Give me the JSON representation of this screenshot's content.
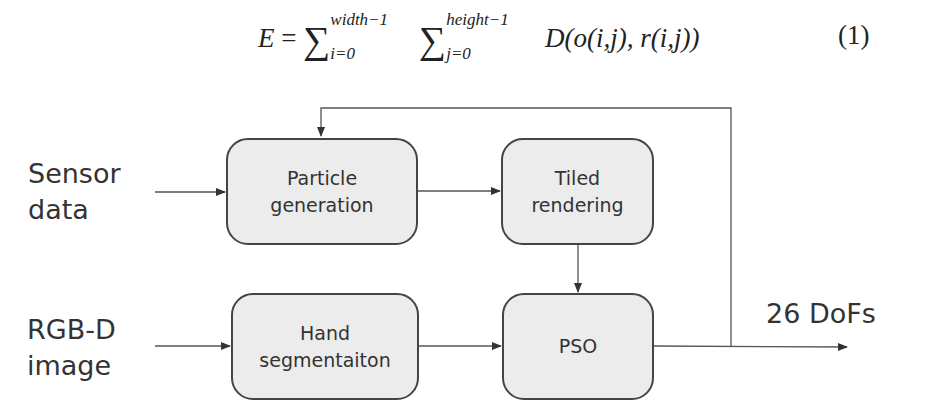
{
  "equation": {
    "lhs": "E",
    "eq": "=",
    "sum1_upper": "width−1",
    "sum1_lower": "i=0",
    "sum2_upper": "height−1",
    "sum2_lower": "j=0",
    "body": "D(o(i,j), r(i,j))",
    "number": "(1)"
  },
  "diagram": {
    "inputs": {
      "sensor_line1": "Sensor",
      "sensor_line2": "data",
      "rgbd_line1": "RGB-D",
      "rgbd_line2": "image"
    },
    "boxes": {
      "particle_line1": "Particle",
      "particle_line2": "generation",
      "tiled_line1": "Tiled",
      "tiled_line2": "rendering",
      "hand_line1": "Hand",
      "hand_line2": "segmentaiton",
      "pso": "PSO"
    },
    "output": "26 DoFs",
    "colors": {
      "box_fill": "#ececec",
      "stroke": "#444444",
      "text": "#333333"
    }
  }
}
